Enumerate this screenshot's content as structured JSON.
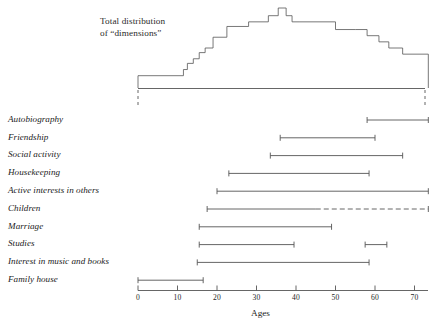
{
  "chart_data": {
    "type": "bar",
    "title_line1": "Total distribution",
    "title_line2": "of “dimensions”",
    "xlabel": "Ages",
    "ylabel": "",
    "xlim": [
      -1,
      75
    ],
    "ticks": [
      0,
      10,
      20,
      30,
      40,
      50,
      60,
      70
    ],
    "tick_labels": [
      "0",
      "10",
      "20",
      "30",
      "40",
      "50",
      "60",
      "70"
    ],
    "grid": false,
    "legend": "none",
    "categories": [
      "Autobiography",
      "Friendship",
      "Social activity",
      "Housekeeping",
      "Active interests in others",
      "Children",
      "Marriage",
      "Studies",
      "Interest in music and books",
      "Family house"
    ],
    "ranges": [
      {
        "label": "Autobiography",
        "segments": [
          {
            "start": 58.0,
            "end": 73.5,
            "style": "solid"
          }
        ]
      },
      {
        "label": "Friendship",
        "segments": [
          {
            "start": 36.0,
            "end": 60.0,
            "style": "solid"
          }
        ]
      },
      {
        "label": "Social activity",
        "segments": [
          {
            "start": 33.5,
            "end": 67.0,
            "style": "solid"
          }
        ]
      },
      {
        "label": "Housekeeping",
        "segments": [
          {
            "start": 23.0,
            "end": 58.5,
            "style": "solid"
          }
        ]
      },
      {
        "label": "Active interests in others",
        "segments": [
          {
            "start": 20.0,
            "end": 73.5,
            "style": "solid"
          }
        ]
      },
      {
        "label": "Children",
        "segments": [
          {
            "start": 17.5,
            "end": 45.0,
            "style": "solid"
          },
          {
            "start": 45.0,
            "end": 73.5,
            "style": "dashed"
          }
        ]
      },
      {
        "label": "Marriage",
        "segments": [
          {
            "start": 15.5,
            "end": 49.0,
            "style": "solid"
          }
        ]
      },
      {
        "label": "Studies",
        "segments": [
          {
            "start": 15.5,
            "end": 39.5,
            "style": "solid"
          },
          {
            "start": 57.5,
            "end": 63.0,
            "style": "solid"
          }
        ]
      },
      {
        "label": "Interest in music and books",
        "segments": [
          {
            "start": 15.0,
            "end": 58.5,
            "style": "solid"
          }
        ]
      },
      {
        "label": "Family house",
        "segments": [
          {
            "start": 0.0,
            "end": 16.5,
            "style": "solid"
          }
        ]
      }
    ],
    "histogram": {
      "description": "Total distribution of dimensions — step outline over age",
      "bin_edges": [
        0,
        11.5,
        12.5,
        14,
        15.5,
        17,
        19,
        22.5,
        28,
        33,
        35.5,
        37.5,
        39,
        41,
        50,
        55,
        58,
        61,
        63.5,
        67,
        73.5
      ],
      "bin_heights": [
        8,
        12,
        16,
        19,
        23,
        26,
        33,
        40,
        43,
        47,
        52,
        47,
        43,
        43,
        38,
        38,
        34,
        30,
        26,
        22
      ],
      "height_unit": "relative"
    },
    "colors": {
      "line": "#555555",
      "text": "#1a1a1a",
      "background": "#ffffff"
    }
  }
}
